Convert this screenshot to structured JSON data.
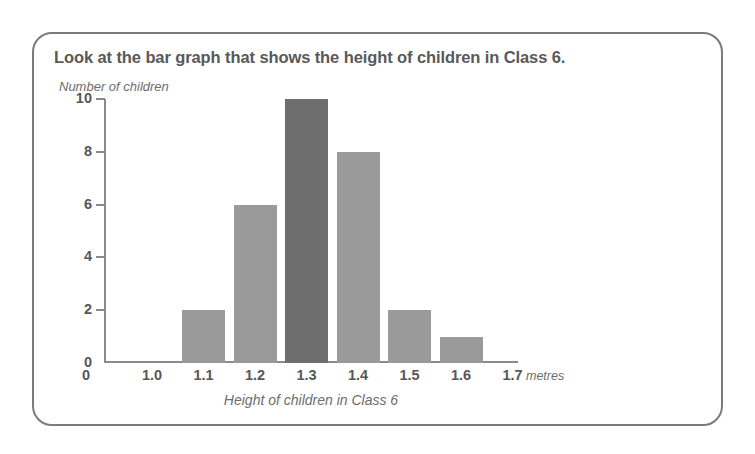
{
  "card": {
    "title": "Look at the bar graph that shows the height of children in Class 6."
  },
  "chart_data": {
    "type": "bar",
    "title": "Look at the bar graph that shows the height of children in Class 6.",
    "subtitle": "",
    "xlabel": "Height of children in Class 6",
    "ylabel": "Number of children",
    "x_units": "metres",
    "categories": [
      "1.0",
      "1.1",
      "1.2",
      "1.3",
      "1.4",
      "1.5",
      "1.6",
      "1.7"
    ],
    "values": [
      0,
      2,
      6,
      10,
      8,
      2,
      1,
      0
    ],
    "bars": [
      {
        "category": "1.1",
        "value": 2,
        "color": "#9a9a9a",
        "highlight": false
      },
      {
        "category": "1.2",
        "value": 6,
        "color": "#9a9a9a",
        "highlight": false
      },
      {
        "category": "1.3",
        "value": 10,
        "color": "#6e6e6e",
        "highlight": true
      },
      {
        "category": "1.4",
        "value": 8,
        "color": "#9a9a9a",
        "highlight": false
      },
      {
        "category": "1.5",
        "value": 2,
        "color": "#9a9a9a",
        "highlight": false
      },
      {
        "category": "1.6",
        "value": 1,
        "color": "#9a9a9a",
        "highlight": false
      }
    ],
    "y_origin_label": "0",
    "y_ticks": [
      2,
      4,
      6,
      8,
      10
    ],
    "y_tick_labels": [
      "2",
      "4",
      "6",
      "8",
      "10"
    ],
    "ylim": [
      0,
      10
    ],
    "xlim": [
      "1.0",
      "1.7"
    ],
    "grid": false,
    "legend": null,
    "colors": {
      "bar_default": "#9a9a9a",
      "bar_highlight": "#6e6e6e",
      "axis": "#8a8a8a",
      "text": "#575757",
      "italic_text": "#6d6d6d",
      "card_border": "#7b7b7b",
      "background": "#ffffff"
    }
  }
}
